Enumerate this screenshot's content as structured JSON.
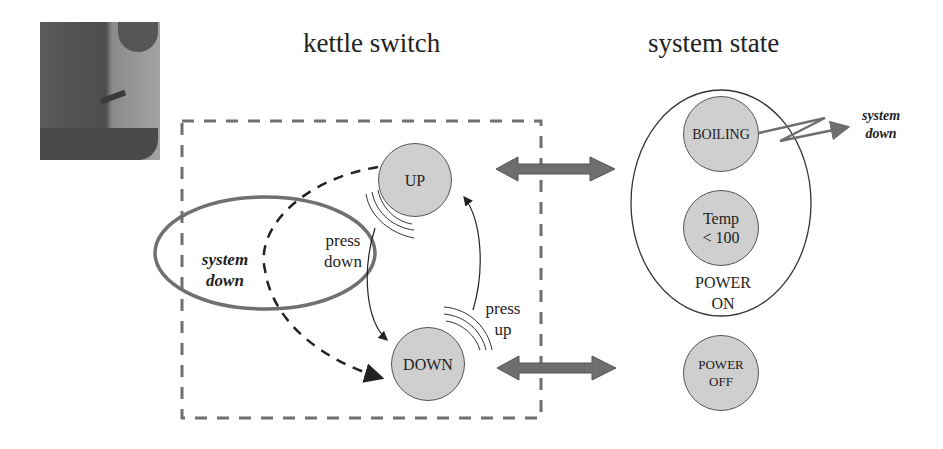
{
  "titles": {
    "left": "kettle switch",
    "right": "system state"
  },
  "photo": {
    "description": "kettle-photo"
  },
  "switch": {
    "up_label": "UP",
    "down_label": "DOWN",
    "press_down_line1": "press",
    "press_down_line2": "down",
    "press_up_line1": "press",
    "press_up_line2": "up",
    "system_down_line1": "system",
    "system_down_line2": "down"
  },
  "state": {
    "boiling_label": "BOILING",
    "temp_line1": "Temp",
    "temp_line2": "< 100",
    "power_on_line1": "POWER",
    "power_on_line2": "ON",
    "power_off_line1": "POWER",
    "power_off_line2": "OFF",
    "system_down_line1": "system",
    "system_down_line2": "down"
  },
  "colors": {
    "node_fill": "#cfcfcf",
    "dashed_box": "#707070",
    "ellipse_system_down": "#707070",
    "double_arrow": "#6e6e6e"
  }
}
